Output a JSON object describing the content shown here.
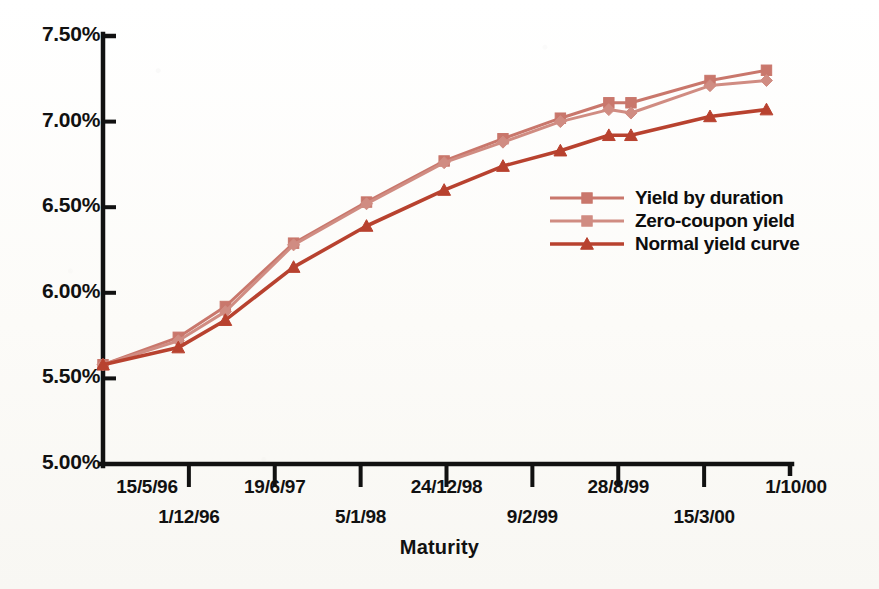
{
  "chart_data": {
    "type": "line",
    "title": "",
    "xlabel": "Maturity",
    "ylabel": "",
    "grid": false,
    "legend_position": "middle-right",
    "ylim": [
      5.0,
      7.5
    ],
    "ytick_labels": [
      "7.50%",
      "7.00%",
      "6.50%",
      "6.00%",
      "5.50%",
      "5.00%"
    ],
    "ytick_values": [
      7.5,
      7.0,
      6.5,
      6.0,
      5.5,
      5.0
    ],
    "xtick_labels": [
      "15/5/96",
      "1/12/96",
      "19/6/97",
      "5/1/98",
      "24/12/98",
      "9/2/99",
      "28/8/99",
      "15/3/00",
      "1/10/00"
    ],
    "x": [
      0,
      1.6,
      2.6,
      4.05,
      5.6,
      7.25,
      8.5,
      9.72,
      10.75,
      11.22,
      12.9,
      14.1
    ],
    "x_labels": [
      "15/5/96",
      "",
      "1/12/96",
      "19/6/97",
      "",
      "5/1/98",
      "",
      "24/12/98",
      "",
      "9/2/99",
      "28/8/99",
      "1/10/00"
    ],
    "series": [
      {
        "name": "Yield by duration",
        "color": "#c9776c",
        "marker": "square",
        "values": [
          5.58,
          5.74,
          5.92,
          6.29,
          6.53,
          6.77,
          6.9,
          7.02,
          7.11,
          7.11,
          7.24,
          7.3
        ]
      },
      {
        "name": "Zero-coupon yield",
        "color": "#d08c82",
        "marker": "diamond",
        "values": [
          5.58,
          5.72,
          5.89,
          6.28,
          6.52,
          6.76,
          6.88,
          7.0,
          7.07,
          7.05,
          7.21,
          7.24
        ]
      },
      {
        "name": "Normal yield curve",
        "color": "#b8422f",
        "marker": "triangle",
        "values": [
          5.58,
          5.68,
          5.84,
          6.15,
          6.39,
          6.6,
          6.74,
          6.83,
          6.92,
          6.92,
          7.03,
          7.07
        ]
      }
    ]
  },
  "axes": {
    "y_ticks": [
      {
        "label": "7.50%"
      },
      {
        "label": "7.00%"
      },
      {
        "label": "6.50%"
      },
      {
        "label": "6.00%"
      },
      {
        "label": "5.50%"
      },
      {
        "label": "5.00%"
      }
    ],
    "x_ticks": [
      {
        "label": "15/5/96"
      },
      {
        "label": "1/12/96"
      },
      {
        "label": "19/6/97"
      },
      {
        "label": "5/1/98"
      },
      {
        "label": "24/12/98"
      },
      {
        "label": "9/2/99"
      },
      {
        "label": "28/8/99"
      },
      {
        "label": "15/3/00"
      },
      {
        "label": "1/10/00"
      }
    ],
    "x_title": "Maturity"
  },
  "legend": {
    "items": [
      {
        "label": "Yield by duration",
        "color": "#c9776c",
        "marker": "square"
      },
      {
        "label": "Zero-coupon yield",
        "color": "#d08c82",
        "marker": "square"
      },
      {
        "label": "Normal yield curve",
        "color": "#b8422f",
        "marker": "triangle"
      }
    ]
  },
  "colors": {
    "axis": "#111111",
    "background": "#fdfdfb",
    "series_1": "#c9776c",
    "series_2": "#d08c82",
    "series_3": "#b8422f"
  }
}
